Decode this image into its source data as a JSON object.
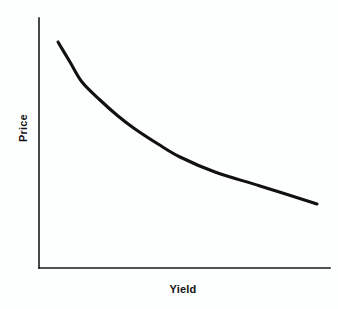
{
  "chart_data": {
    "type": "line",
    "title": "",
    "subtitle": "",
    "xlabel": "Yield",
    "ylabel": "Price",
    "xlim": [
      0,
      100
    ],
    "ylim": [
      0,
      100
    ],
    "grid": false,
    "legend": false,
    "legend_position": "none",
    "xticks": [],
    "yticks": [],
    "xticklabels": [],
    "yticklabels": [],
    "annotations": [],
    "series": [
      {
        "name": "Price-Yield Curve",
        "color": "#111111",
        "linewidth": 3,
        "x": [
          6.5,
          10,
          14,
          19,
          25,
          33,
          43,
          55,
          68,
          82,
          95
        ],
        "y": [
          89,
          80,
          69,
          59,
          50,
          42,
          35,
          29,
          24,
          20,
          17.5
        ],
        "pixel_points": [
          [
            58,
            42
          ],
          [
            70,
            62
          ],
          [
            82,
            82
          ],
          [
            100,
            100
          ],
          [
            118,
            116
          ],
          [
            135,
            129
          ],
          [
            158,
            144
          ],
          [
            180,
            157
          ],
          [
            215,
            172
          ],
          [
            260,
            186
          ],
          [
            317,
            204
          ]
        ]
      }
    ]
  },
  "figure": {
    "background_color": "#fdfefe",
    "axis_color": "#1a1a1a",
    "curve_color": "#111111",
    "axes": {
      "y_axis_label": "Price",
      "x_axis_label": "Yield",
      "origin_px": [
        39,
        268
      ],
      "y_axis_top_px": [
        39,
        18
      ],
      "x_axis_right_px": [
        330,
        268
      ]
    }
  }
}
